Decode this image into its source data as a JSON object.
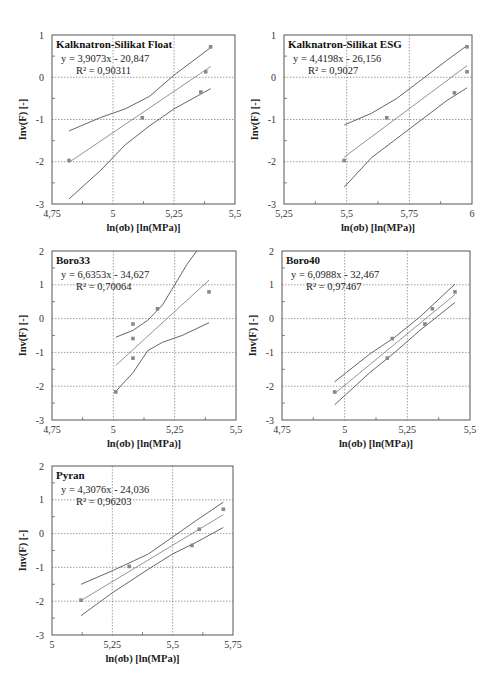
{
  "chart_data": [
    {
      "type": "scatter",
      "title": "Kalknatron-Silikat Float",
      "equation": "y = 3,9073x - 20,847",
      "r2": "R² = 0,90311",
      "slope": 3.9073,
      "intercept": -20.847,
      "xlabel": "ln(σb) [ln(MPa)]",
      "ylabel": "Inv(F) [-]",
      "xlim": [
        4.75,
        5.5
      ],
      "ylim": [
        -3,
        1
      ],
      "xticks": [
        "4,75",
        "5",
        "5,25",
        "5,5"
      ],
      "xtick_values": [
        4.75,
        5.0,
        5.25,
        5.5
      ],
      "yticks": [
        "-3",
        "-2",
        "-1",
        "0",
        "1"
      ],
      "ytick_values": [
        -3,
        -2,
        -1,
        0,
        1
      ],
      "points": [
        [
          4.82,
          -1.97
        ],
        [
          5.12,
          -0.96
        ],
        [
          5.36,
          -0.35
        ],
        [
          5.38,
          0.13
        ],
        [
          5.4,
          0.72
        ]
      ],
      "fit_x": [
        4.82,
        5.4
      ],
      "upper": [
        [
          4.82,
          -1.27
        ],
        [
          4.95,
          -0.95
        ],
        [
          5.05,
          -0.75
        ],
        [
          5.15,
          -0.45
        ],
        [
          5.25,
          0.05
        ],
        [
          5.4,
          0.7
        ]
      ],
      "lower": [
        [
          4.82,
          -2.88
        ],
        [
          4.95,
          -2.2
        ],
        [
          5.05,
          -1.6
        ],
        [
          5.15,
          -1.15
        ],
        [
          5.25,
          -0.75
        ],
        [
          5.4,
          -0.27
        ]
      ],
      "frame": [
        52,
        35,
        235,
        204
      ],
      "grid": true
    },
    {
      "type": "scatter",
      "title": "Kalknatron-Silikat ESG",
      "equation": "y = 4,4198x - 26,156",
      "r2": "R² = 0,9027",
      "slope": 4.4198,
      "intercept": -26.156,
      "xlabel": "ln(σb) [ln(MPa)]",
      "ylabel": "Inv(F) [-]",
      "xlim": [
        5.25,
        6.0
      ],
      "ylim": [
        -3,
        1
      ],
      "xticks": [
        "5,25",
        "5,5",
        "5,75",
        "6"
      ],
      "xtick_values": [
        5.25,
        5.5,
        5.75,
        6.0
      ],
      "yticks": [
        "-3",
        "-2",
        "-1",
        "0",
        "1"
      ],
      "ytick_values": [
        -3,
        -2,
        -1,
        0,
        1
      ],
      "points": [
        [
          5.49,
          -1.97
        ],
        [
          5.66,
          -0.96
        ],
        [
          5.93,
          -0.37
        ],
        [
          5.98,
          0.13
        ],
        [
          5.98,
          0.72
        ]
      ],
      "fit_x": [
        5.49,
        5.98
      ],
      "upper": [
        [
          5.49,
          -1.13
        ],
        [
          5.6,
          -0.85
        ],
        [
          5.7,
          -0.5
        ],
        [
          5.8,
          -0.05
        ],
        [
          5.9,
          0.4
        ],
        [
          5.98,
          0.75
        ]
      ],
      "lower": [
        [
          5.49,
          -2.6
        ],
        [
          5.6,
          -1.9
        ],
        [
          5.7,
          -1.45
        ],
        [
          5.8,
          -1.0
        ],
        [
          5.9,
          -0.55
        ],
        [
          5.98,
          -0.25
        ]
      ],
      "frame": [
        284,
        35,
        472,
        204
      ],
      "grid": true
    },
    {
      "type": "scatter",
      "title": "Boro33",
      "equation": "y = 6,6353x - 34,627",
      "r2": "R² = 0,70064",
      "slope": 6.6353,
      "intercept": -34.627,
      "xlabel": "ln(σb) [ln(MPa)]",
      "ylabel": "Inv(F) [-]",
      "xlim": [
        4.75,
        5.5
      ],
      "ylim": [
        -3,
        2
      ],
      "xticks": [
        "4,75",
        "5",
        "5,25",
        "5,5"
      ],
      "xtick_values": [
        4.75,
        5.0,
        5.25,
        5.5
      ],
      "yticks": [
        "-3",
        "-2",
        "-1",
        "0",
        "1",
        "2"
      ],
      "ytick_values": [
        -3,
        -2,
        -1,
        0,
        1,
        2
      ],
      "points": [
        [
          5.01,
          -2.17
        ],
        [
          5.08,
          -1.17
        ],
        [
          5.08,
          -0.59
        ],
        [
          5.08,
          -0.16
        ],
        [
          5.18,
          0.29
        ],
        [
          5.39,
          0.79
        ]
      ],
      "fit_x": [
        5.01,
        5.39
      ],
      "upper": [
        [
          5.01,
          -0.55
        ],
        [
          5.08,
          -0.35
        ],
        [
          5.14,
          -0.05
        ],
        [
          5.2,
          0.4
        ],
        [
          5.25,
          1.0
        ],
        [
          5.3,
          1.6
        ],
        [
          5.34,
          2.0
        ]
      ],
      "lower": [
        [
          5.01,
          -2.15
        ],
        [
          5.08,
          -1.6
        ],
        [
          5.14,
          -0.95
        ],
        [
          5.2,
          -0.7
        ],
        [
          5.28,
          -0.5
        ],
        [
          5.39,
          -0.12
        ]
      ],
      "frame": [
        52,
        251,
        236,
        420
      ],
      "grid": true
    },
    {
      "type": "scatter",
      "title": "Boro40",
      "equation": "y = 6,0988x - 32,467",
      "r2": "R² = 0,97467",
      "slope": 6.0988,
      "intercept": -32.467,
      "xlabel": "ln(σb) [ln(MPa)]",
      "ylabel": "Inv(F) [-]",
      "xlim": [
        4.75,
        5.5
      ],
      "ylim": [
        -3,
        2
      ],
      "xticks": [
        "4,75",
        "5",
        "5,25",
        "5,5"
      ],
      "xtick_values": [
        4.75,
        5.0,
        5.25,
        5.5
      ],
      "yticks": [
        "-3",
        "-2",
        "-1",
        "0",
        "1",
        "2"
      ],
      "ytick_values": [
        -3,
        -2,
        -1,
        0,
        1,
        2
      ],
      "points": [
        [
          4.96,
          -2.17
        ],
        [
          5.17,
          -1.17
        ],
        [
          5.19,
          -0.59
        ],
        [
          5.32,
          -0.16
        ],
        [
          5.35,
          0.29
        ],
        [
          5.44,
          0.79
        ]
      ],
      "fit_x": [
        4.96,
        5.44
      ],
      "upper": [
        [
          4.96,
          -1.87
        ],
        [
          5.1,
          -1.05
        ],
        [
          5.2,
          -0.55
        ],
        [
          5.3,
          0.05
        ],
        [
          5.44,
          1.02
        ]
      ],
      "lower": [
        [
          4.96,
          -2.55
        ],
        [
          5.1,
          -1.6
        ],
        [
          5.2,
          -1.0
        ],
        [
          5.3,
          -0.35
        ],
        [
          5.44,
          0.48
        ]
      ],
      "frame": [
        282,
        251,
        470,
        420
      ],
      "grid": true
    },
    {
      "type": "scatter",
      "title": "Pyran",
      "equation": "y = 4,3076x - 24,036",
      "r2": "R² = 0,96203",
      "slope": 4.3076,
      "intercept": -24.036,
      "xlabel": "ln(σb) [ln(MPa)]",
      "ylabel": "Inv(F) [-]",
      "xlim": [
        5.0,
        5.75
      ],
      "ylim": [
        -3,
        2
      ],
      "xticks": [
        "5",
        "5,25",
        "5,5",
        "5,75"
      ],
      "xtick_values": [
        5.0,
        5.25,
        5.5,
        5.75
      ],
      "yticks": [
        "-3",
        "-2",
        "-1",
        "0",
        "1",
        "2"
      ],
      "ytick_values": [
        -3,
        -2,
        -1,
        0,
        1,
        2
      ],
      "points": [
        [
          5.12,
          -1.97
        ],
        [
          5.32,
          -0.97
        ],
        [
          5.58,
          -0.35
        ],
        [
          5.61,
          0.13
        ],
        [
          5.71,
          0.72
        ]
      ],
      "fit_x": [
        5.12,
        5.71
      ],
      "upper": [
        [
          5.12,
          -1.5
        ],
        [
          5.25,
          -1.1
        ],
        [
          5.4,
          -0.6
        ],
        [
          5.5,
          -0.1
        ],
        [
          5.6,
          0.4
        ],
        [
          5.71,
          0.93
        ]
      ],
      "lower": [
        [
          5.12,
          -2.43
        ],
        [
          5.25,
          -1.75
        ],
        [
          5.4,
          -1.05
        ],
        [
          5.5,
          -0.6
        ],
        [
          5.6,
          -0.25
        ],
        [
          5.71,
          0.18
        ]
      ],
      "frame": [
        52,
        466,
        233,
        635
      ],
      "grid": true
    }
  ]
}
